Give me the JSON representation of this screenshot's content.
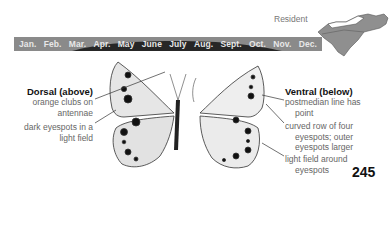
{
  "range": {
    "status_label": "Resident",
    "map_icon": "state-map-north-south-carolina",
    "months": [
      "Jan.",
      "Feb.",
      "Mar.",
      "Apr.",
      "May",
      "June",
      "July",
      "Aug.",
      "Sept.",
      "Oct.",
      "Nov.",
      "Dec."
    ],
    "bar_color": "#8a8a8a",
    "flight_peak_color": "#262626"
  },
  "dorsal": {
    "title": "Dorsal (above)",
    "notes": [
      {
        "line1": "orange clubs on",
        "line2": "antennae"
      },
      {
        "line1": "dark eyespots in a",
        "line2": "light field"
      }
    ]
  },
  "ventral": {
    "title": "Ventral (below)",
    "notes": [
      {
        "line1": "postmedian line has",
        "line2": "point"
      },
      {
        "line1": "curved row of four",
        "line2": "eyespots; outer",
        "line3": "eyespots larger"
      },
      {
        "line1": "light field around",
        "line2": "eyespots"
      }
    ]
  },
  "page_number": "245"
}
